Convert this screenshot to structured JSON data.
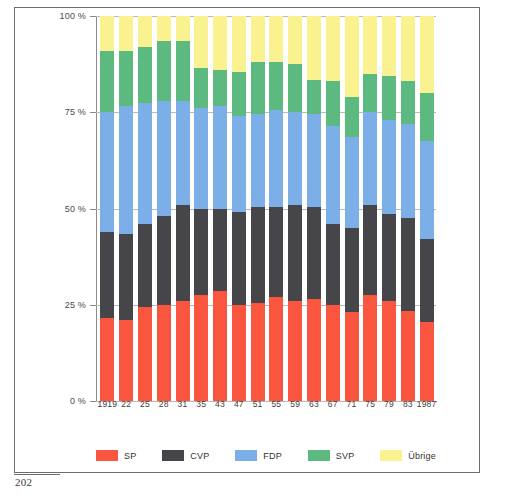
{
  "page": {
    "number": "202"
  },
  "chart_data": {
    "type": "bar",
    "subtype": "stacked-percentage",
    "title": "",
    "xlabel": "",
    "ylabel": "",
    "ylim": [
      0,
      100
    ],
    "yticks": [
      0,
      25,
      50,
      75,
      100
    ],
    "ytick_labels": [
      "0 %",
      "25 %",
      "50 %",
      "75 %",
      "100 %"
    ],
    "grid": true,
    "legend_position": "bottom",
    "categories": [
      "1919",
      "22",
      "25",
      "28",
      "31",
      "35",
      "43",
      "47",
      "51",
      "55",
      "59",
      "63",
      "67",
      "71",
      "75",
      "79",
      "83",
      "1987"
    ],
    "series": [
      {
        "name": "SP",
        "color": "#f9553f",
        "values": [
          21.5,
          21.0,
          24.5,
          25.0,
          26.0,
          27.5,
          28.5,
          25.0,
          25.5,
          27.0,
          26.0,
          26.5,
          25.0,
          23.0,
          27.5,
          26.0,
          23.5,
          20.5
        ]
      },
      {
        "name": "CVP",
        "color": "#46464a",
        "values": [
          22.5,
          22.5,
          21.5,
          23.0,
          25.0,
          22.5,
          21.5,
          24.0,
          25.0,
          23.5,
          25.0,
          24.0,
          21.0,
          22.0,
          23.5,
          22.5,
          24.0,
          21.5
        ]
      },
      {
        "name": "FDP",
        "color": "#7cafe7",
        "values": [
          31.0,
          33.0,
          31.5,
          30.0,
          27.0,
          26.0,
          26.5,
          25.0,
          24.0,
          25.0,
          24.0,
          24.0,
          25.5,
          23.5,
          24.0,
          24.5,
          24.5,
          25.5
        ]
      },
      {
        "name": "SVP",
        "color": "#5cba80",
        "values": [
          16.0,
          14.5,
          14.5,
          15.5,
          15.5,
          10.5,
          9.5,
          11.5,
          13.5,
          12.5,
          12.5,
          9.0,
          11.5,
          10.5,
          10.0,
          11.5,
          11.0,
          12.5
        ]
      },
      {
        "name": "Übrige",
        "color": "#faf291",
        "values": [
          9.0,
          9.0,
          8.0,
          6.5,
          6.5,
          13.5,
          14.0,
          14.5,
          12.0,
          12.0,
          12.5,
          16.5,
          17.0,
          21.0,
          15.0,
          15.5,
          17.0,
          20.0
        ]
      }
    ],
    "legend": [
      {
        "label": "SP",
        "color": "#f9553f"
      },
      {
        "label": "CVP",
        "color": "#46464a"
      },
      {
        "label": "FDP",
        "color": "#7cafe7"
      },
      {
        "label": "SVP",
        "color": "#5cba80"
      },
      {
        "label": "Übrige",
        "color": "#faf291"
      }
    ]
  }
}
